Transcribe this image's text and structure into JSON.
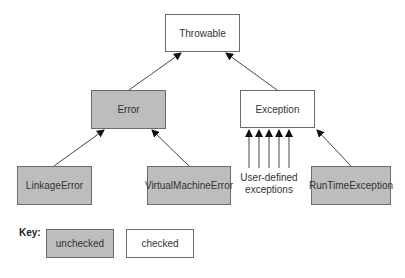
{
  "diagram": {
    "nodes": [
      {
        "id": "throwable",
        "label": "Throwable",
        "kind": "checked"
      },
      {
        "id": "error",
        "label": "Error",
        "kind": "unchecked"
      },
      {
        "id": "exception",
        "label": "Exception",
        "kind": "checked"
      },
      {
        "id": "linkage_error",
        "label": "LinkageError",
        "kind": "unchecked"
      },
      {
        "id": "vm_error",
        "label": "VirtualMachineError",
        "kind": "unchecked"
      },
      {
        "id": "runtime_exception",
        "label": "RunTimeException",
        "kind": "unchecked"
      }
    ],
    "edges": [
      {
        "from": "error",
        "to": "throwable"
      },
      {
        "from": "exception",
        "to": "throwable"
      },
      {
        "from": "linkage_error",
        "to": "error"
      },
      {
        "from": "vm_error",
        "to": "error"
      },
      {
        "from": "user_defined",
        "to": "exception",
        "count": 5
      },
      {
        "from": "runtime_exception",
        "to": "exception"
      }
    ],
    "user_defined_caption": {
      "line1": "User-defined",
      "line2": "exceptions"
    },
    "key": {
      "label": "Key:",
      "items": [
        {
          "label": "unchecked",
          "fill": "#bdbdbd"
        },
        {
          "label": "checked",
          "fill": "#ffffff"
        }
      ]
    }
  }
}
